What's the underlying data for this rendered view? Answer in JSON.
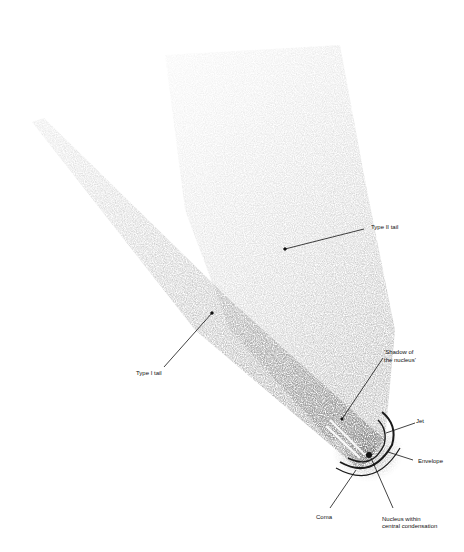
{
  "diagram": {
    "labels": {
      "type2_tail": "Type II tail",
      "type1_tail": "Type I tail",
      "shadow_line1": "'Shadow of",
      "shadow_line2": "the nucleus'",
      "jet": "Jet",
      "envelope": "Envelope",
      "coma": "Coma",
      "nucleus_line1": "Nucleus within",
      "nucleus_line2": "central condensation"
    },
    "colors": {
      "background": "#ffffff",
      "ink": "#111111",
      "tail_shade": "#9a9a9a"
    }
  }
}
